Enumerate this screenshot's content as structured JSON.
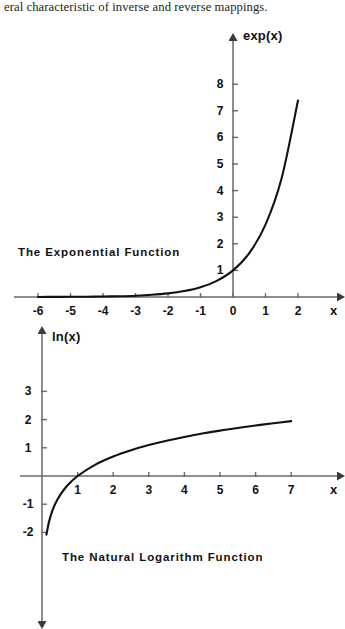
{
  "page": {
    "body_text": "eral characteristic of inverse and reverse mappings.",
    "background_color": "#ffffff",
    "ink_color": "#1a1a1a"
  },
  "chart_data": [
    {
      "type": "line",
      "title": "The Exponential Function",
      "function": "exp(x)",
      "xlabel": "x",
      "ylabel": "exp(x)",
      "xlim": [
        -6.6,
        2.7
      ],
      "ylim": [
        -0.55,
        8.9
      ],
      "xticks": [
        -6,
        -5,
        -4,
        -3,
        -2,
        -1,
        0,
        1,
        2
      ],
      "xtick_labels": [
        "-6",
        "-5",
        "-4",
        "-3",
        "-2",
        "-1",
        "0",
        "1",
        "2"
      ],
      "yticks": [
        1,
        2,
        3,
        4,
        5,
        6,
        7,
        8
      ],
      "ytick_labels": [
        "1",
        "2",
        "3",
        "4",
        "5",
        "6",
        "7",
        "8"
      ],
      "grid": false,
      "legend": "none",
      "axis_arrows": [
        "x-right",
        "y-up"
      ],
      "x": [
        -6,
        -5.5,
        -5,
        -4.5,
        -4,
        -3.5,
        -3,
        -2.5,
        -2,
        -1.5,
        -1,
        -0.5,
        0,
        0.5,
        1,
        1.5,
        2
      ],
      "y": [
        0.0025,
        0.0041,
        0.0067,
        0.0111,
        0.0183,
        0.0302,
        0.0498,
        0.0821,
        0.1353,
        0.2231,
        0.3679,
        0.6065,
        1.0,
        1.6487,
        2.7183,
        4.4817,
        7.3891
      ]
    },
    {
      "type": "line",
      "title": "The Natural Logarithm Function",
      "function": "ln(x)",
      "xlabel": "x",
      "ylabel": "ln(x)",
      "xlim": [
        -0.55,
        7.9
      ],
      "ylim": [
        -2.95,
        3.9
      ],
      "xticks": [
        1,
        2,
        3,
        4,
        5,
        6,
        7
      ],
      "xtick_labels": [
        "1",
        "2",
        "3",
        "4",
        "5",
        "6",
        "7"
      ],
      "yticks": [
        -2,
        -1,
        1,
        2,
        3
      ],
      "ytick_labels": [
        "-2",
        "-1",
        "1",
        "2",
        "3"
      ],
      "grid": false,
      "legend": "none",
      "axis_arrows": [
        "x-right",
        "y-up",
        "y-down"
      ],
      "x": [
        0.125,
        0.2,
        0.3,
        0.4,
        0.5,
        0.7,
        1.0,
        1.5,
        2.0,
        2.5,
        3.0,
        3.5,
        4.0,
        4.5,
        5.0,
        5.5,
        6.0,
        6.5,
        7.0
      ],
      "y": [
        -2.079,
        -1.609,
        -1.204,
        -0.916,
        -0.693,
        -0.357,
        0.0,
        0.405,
        0.693,
        0.916,
        1.099,
        1.253,
        1.386,
        1.504,
        1.609,
        1.705,
        1.792,
        1.872,
        1.946
      ]
    }
  ]
}
